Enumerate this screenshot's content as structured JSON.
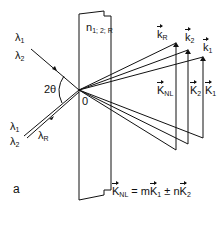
{
  "figure": {
    "panel_label": "a",
    "medium_label": "n",
    "medium_subscript": "1; 2; R",
    "angle_label": "2θ",
    "origin_label": "0",
    "incident": {
      "lambda1": "λ",
      "lambda1_sub": "1",
      "lambda2": "λ",
      "lambda2_sub": "2"
    },
    "reflected": {
      "lambda1": "λ",
      "lambda1_sub": "1",
      "lambda2": "λ",
      "lambda2_sub": "2",
      "lambdaR": "λ",
      "lambdaR_sub": "R"
    },
    "wavevectors": [
      {
        "symbol": "k",
        "sub": "R"
      },
      {
        "symbol": "k",
        "sub": "2"
      },
      {
        "symbol": "k",
        "sub": "1"
      }
    ],
    "grating_vectors": [
      {
        "symbol": "K",
        "sub": "NL"
      },
      {
        "symbol": "K",
        "sub": "2"
      },
      {
        "symbol": "K",
        "sub": "1"
      }
    ],
    "equation": {
      "lhs": "K",
      "lhs_sub": "NL",
      "eq": " = m",
      "t1": "K",
      "t1_sub": "1",
      "op": " ± n",
      "t2": "K",
      "t2_sub": "2"
    }
  }
}
